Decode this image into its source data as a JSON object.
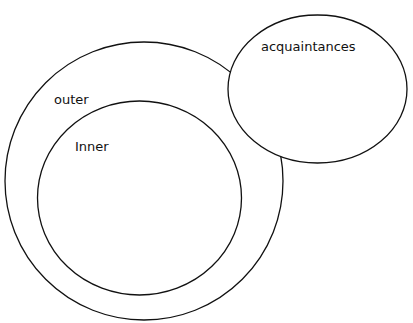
{
  "diagram": {
    "circles": [
      {
        "id": "outer",
        "label": "outer"
      },
      {
        "id": "inner",
        "label": "Inner"
      },
      {
        "id": "acquaintances",
        "label": "acquaintances"
      }
    ],
    "stroke_color": "#111111",
    "background": "#ffffff"
  }
}
